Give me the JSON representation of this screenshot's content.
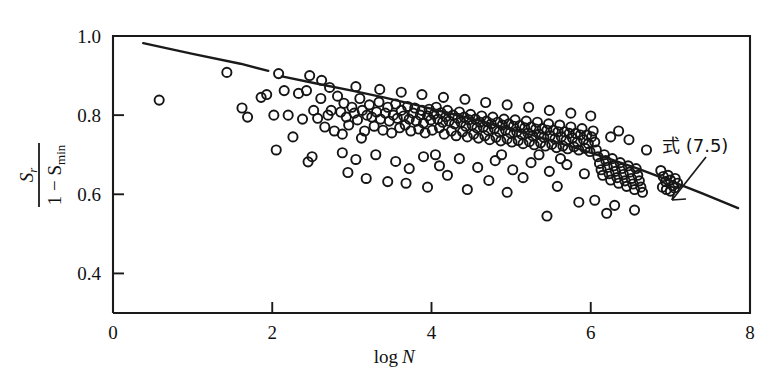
{
  "figure": {
    "background_color": "#ffffff",
    "ink_color": "#1a1a1a",
    "width": 778,
    "height": 385
  },
  "axes": {
    "x": {
      "label": "log N",
      "label_main": "log",
      "label_italic": "N",
      "ticks": [
        "0",
        "2",
        "4",
        "6",
        "8"
      ],
      "tick_values": [
        0,
        2,
        4,
        6,
        8
      ],
      "range": [
        0,
        8
      ]
    },
    "y": {
      "label_numerator": "S",
      "label_numerator_sub": "r",
      "label_denominator_lead": "1 − S",
      "label_denominator_sub": "min",
      "label_plain": "S_r / (1 - S_min)",
      "ticks": [
        "0.4",
        "0.6",
        "0.8",
        "1.0"
      ],
      "tick_values": [
        0.4,
        0.6,
        0.8,
        1.0
      ],
      "range": [
        0.3,
        1.0
      ]
    }
  },
  "annotations": [
    {
      "name": "equation-callout",
      "text": "式 (7.5)",
      "meaning": "Equation (7.5)",
      "x": 6.75,
      "y": 0.705,
      "leader_to_x": 6.55,
      "leader_to_y": 0.625
    }
  ],
  "chart_data": {
    "type": "scatter",
    "title": "",
    "xlabel": "log N",
    "ylabel": "S_r / (1 - S_min)",
    "xlim": [
      0,
      8
    ],
    "ylim": [
      0.3,
      1.0
    ],
    "grid": false,
    "legend": "none",
    "marker": "open-circle",
    "marker_size": 4.6,
    "series": [
      {
        "name": "measured data",
        "type": "scatter",
        "points": [
          [
            0.58,
            0.838
          ],
          [
            1.43,
            0.908
          ],
          [
            1.62,
            0.818
          ],
          [
            1.69,
            0.795
          ],
          [
            1.86,
            0.845
          ],
          [
            1.93,
            0.852
          ],
          [
            2.02,
            0.8
          ],
          [
            2.08,
            0.905
          ],
          [
            2.15,
            0.862
          ],
          [
            2.2,
            0.8
          ],
          [
            2.26,
            0.745
          ],
          [
            2.33,
            0.855
          ],
          [
            2.38,
            0.79
          ],
          [
            2.43,
            0.862
          ],
          [
            2.47,
            0.9
          ],
          [
            2.52,
            0.812
          ],
          [
            2.57,
            0.792
          ],
          [
            2.61,
            0.842
          ],
          [
            2.66,
            0.77
          ],
          [
            2.7,
            0.8
          ],
          [
            2.74,
            0.812
          ],
          [
            2.78,
            0.76
          ],
          [
            2.82,
            0.848
          ],
          [
            2.86,
            0.808
          ],
          [
            2.9,
            0.83
          ],
          [
            2.93,
            0.795
          ],
          [
            2.96,
            0.775
          ],
          [
            3.0,
            0.82
          ],
          [
            3.03,
            0.805
          ],
          [
            3.07,
            0.788
          ],
          [
            3.1,
            0.842
          ],
          [
            3.13,
            0.812
          ],
          [
            3.16,
            0.76
          ],
          [
            3.19,
            0.8
          ],
          [
            3.22,
            0.826
          ],
          [
            3.25,
            0.795
          ],
          [
            3.28,
            0.772
          ],
          [
            3.31,
            0.808
          ],
          [
            3.34,
            0.833
          ],
          [
            3.36,
            0.79
          ],
          [
            3.39,
            0.762
          ],
          [
            3.42,
            0.805
          ],
          [
            3.45,
            0.82
          ],
          [
            3.47,
            0.785
          ],
          [
            3.5,
            0.755
          ],
          [
            3.52,
            0.8
          ],
          [
            3.55,
            0.828
          ],
          [
            3.57,
            0.792
          ],
          [
            3.6,
            0.768
          ],
          [
            3.62,
            0.812
          ],
          [
            3.65,
            0.798
          ],
          [
            3.67,
            0.775
          ],
          [
            3.7,
            0.822
          ],
          [
            3.72,
            0.79
          ],
          [
            3.74,
            0.76
          ],
          [
            3.77,
            0.805
          ],
          [
            3.79,
            0.818
          ],
          [
            3.81,
            0.785
          ],
          [
            3.84,
            0.765
          ],
          [
            3.86,
            0.8
          ],
          [
            3.88,
            0.812
          ],
          [
            3.9,
            0.78
          ],
          [
            3.92,
            0.755
          ],
          [
            3.95,
            0.798
          ],
          [
            3.97,
            0.815
          ],
          [
            3.99,
            0.788
          ],
          [
            4.01,
            0.762
          ],
          [
            4.03,
            0.802
          ],
          [
            4.06,
            0.82
          ],
          [
            4.08,
            0.79
          ],
          [
            4.1,
            0.768
          ],
          [
            4.12,
            0.806
          ],
          [
            4.14,
            0.782
          ],
          [
            4.16,
            0.752
          ],
          [
            4.18,
            0.796
          ],
          [
            4.2,
            0.812
          ],
          [
            4.22,
            0.785
          ],
          [
            4.25,
            0.76
          ],
          [
            4.27,
            0.8
          ],
          [
            4.29,
            0.778
          ],
          [
            4.31,
            0.748
          ],
          [
            4.33,
            0.792
          ],
          [
            4.35,
            0.808
          ],
          [
            4.37,
            0.782
          ],
          [
            4.39,
            0.758
          ],
          [
            4.41,
            0.795
          ],
          [
            4.43,
            0.772
          ],
          [
            4.45,
            0.745
          ],
          [
            4.47,
            0.788
          ],
          [
            4.49,
            0.802
          ],
          [
            4.51,
            0.775
          ],
          [
            4.53,
            0.752
          ],
          [
            4.55,
            0.79
          ],
          [
            4.57,
            0.768
          ],
          [
            4.59,
            0.742
          ],
          [
            4.61,
            0.782
          ],
          [
            4.63,
            0.798
          ],
          [
            4.65,
            0.77
          ],
          [
            4.67,
            0.748
          ],
          [
            4.69,
            0.785
          ],
          [
            4.71,
            0.762
          ],
          [
            4.73,
            0.738
          ],
          [
            4.75,
            0.778
          ],
          [
            4.77,
            0.795
          ],
          [
            4.79,
            0.766
          ],
          [
            4.81,
            0.744
          ],
          [
            4.83,
            0.782
          ],
          [
            4.85,
            0.758
          ],
          [
            4.87,
            0.735
          ],
          [
            4.89,
            0.775
          ],
          [
            4.91,
            0.79
          ],
          [
            4.93,
            0.762
          ],
          [
            4.95,
            0.74
          ],
          [
            4.97,
            0.778
          ],
          [
            4.99,
            0.755
          ],
          [
            5.01,
            0.732
          ],
          [
            5.03,
            0.772
          ],
          [
            5.05,
            0.788
          ],
          [
            5.07,
            0.758
          ],
          [
            5.09,
            0.736
          ],
          [
            5.11,
            0.774
          ],
          [
            5.13,
            0.752
          ],
          [
            5.15,
            0.728
          ],
          [
            5.17,
            0.768
          ],
          [
            5.19,
            0.785
          ],
          [
            5.21,
            0.755
          ],
          [
            5.23,
            0.733
          ],
          [
            5.25,
            0.77
          ],
          [
            5.27,
            0.748
          ],
          [
            5.29,
            0.725
          ],
          [
            5.31,
            0.765
          ],
          [
            5.33,
            0.782
          ],
          [
            5.35,
            0.752
          ],
          [
            5.37,
            0.73
          ],
          [
            5.39,
            0.766
          ],
          [
            5.41,
            0.744
          ],
          [
            5.43,
            0.722
          ],
          [
            5.45,
            0.762
          ],
          [
            5.47,
            0.778
          ],
          [
            5.49,
            0.748
          ],
          [
            5.51,
            0.726
          ],
          [
            5.53,
            0.762
          ],
          [
            5.55,
            0.74
          ],
          [
            5.57,
            0.718
          ],
          [
            5.59,
            0.758
          ],
          [
            5.61,
            0.775
          ],
          [
            5.63,
            0.745
          ],
          [
            5.65,
            0.722
          ],
          [
            5.67,
            0.758
          ],
          [
            5.69,
            0.736
          ],
          [
            5.71,
            0.715
          ],
          [
            5.73,
            0.754
          ],
          [
            5.75,
            0.77
          ],
          [
            5.77,
            0.742
          ],
          [
            5.79,
            0.72
          ],
          [
            5.81,
            0.754
          ],
          [
            5.83,
            0.732
          ],
          [
            5.85,
            0.712
          ],
          [
            5.87,
            0.75
          ],
          [
            5.89,
            0.766
          ],
          [
            5.91,
            0.738
          ],
          [
            5.93,
            0.716
          ],
          [
            5.95,
            0.75
          ],
          [
            5.97,
            0.728
          ],
          [
            5.99,
            0.708
          ],
          [
            6.01,
            0.745
          ],
          [
            6.03,
            0.76
          ],
          [
            6.05,
            0.732
          ],
          [
            6.07,
            0.712
          ],
          [
            6.09,
            0.695
          ],
          [
            6.11,
            0.678
          ],
          [
            6.13,
            0.662
          ],
          [
            6.15,
            0.648
          ],
          [
            6.17,
            0.7
          ],
          [
            6.19,
            0.685
          ],
          [
            6.21,
            0.668
          ],
          [
            6.23,
            0.652
          ],
          [
            6.25,
            0.636
          ],
          [
            6.27,
            0.69
          ],
          [
            6.29,
            0.672
          ],
          [
            6.31,
            0.658
          ],
          [
            6.33,
            0.642
          ],
          [
            6.35,
            0.628
          ],
          [
            6.37,
            0.68
          ],
          [
            6.39,
            0.665
          ],
          [
            6.41,
            0.65
          ],
          [
            6.43,
            0.634
          ],
          [
            6.45,
            0.62
          ],
          [
            6.47,
            0.672
          ],
          [
            6.49,
            0.656
          ],
          [
            6.51,
            0.64
          ],
          [
            6.53,
            0.626
          ],
          [
            6.55,
            0.612
          ],
          [
            6.57,
            0.665
          ],
          [
            6.59,
            0.648
          ],
          [
            6.61,
            0.634
          ],
          [
            6.63,
            0.618
          ],
          [
            6.65,
            0.605
          ],
          [
            6.88,
            0.66
          ],
          [
            6.91,
            0.645
          ],
          [
            6.94,
            0.632
          ],
          [
            6.97,
            0.648
          ],
          [
            7.0,
            0.636
          ],
          [
            7.03,
            0.622
          ],
          [
            7.06,
            0.64
          ],
          [
            7.09,
            0.628
          ],
          [
            6.9,
            0.618
          ],
          [
            6.95,
            0.612
          ],
          [
            7.0,
            0.608
          ],
          [
            7.05,
            0.616
          ],
          [
            2.05,
            0.712
          ],
          [
            2.5,
            0.695
          ],
          [
            2.88,
            0.705
          ],
          [
            3.05,
            0.688
          ],
          [
            3.3,
            0.7
          ],
          [
            3.55,
            0.683
          ],
          [
            3.72,
            0.665
          ],
          [
            3.9,
            0.695
          ],
          [
            4.1,
            0.672
          ],
          [
            4.35,
            0.69
          ],
          [
            4.58,
            0.668
          ],
          [
            4.8,
            0.685
          ],
          [
            5.02,
            0.662
          ],
          [
            5.25,
            0.68
          ],
          [
            5.48,
            0.658
          ],
          [
            5.7,
            0.675
          ],
          [
            5.92,
            0.652
          ],
          [
            3.18,
            0.64
          ],
          [
            3.68,
            0.628
          ],
          [
            4.2,
            0.648
          ],
          [
            4.72,
            0.635
          ],
          [
            5.15,
            0.642
          ],
          [
            5.58,
            0.62
          ],
          [
            6.05,
            0.585
          ],
          [
            6.3,
            0.572
          ],
          [
            5.45,
            0.545
          ],
          [
            4.95,
            0.605
          ],
          [
            4.45,
            0.612
          ],
          [
            3.95,
            0.618
          ],
          [
            3.45,
            0.632
          ],
          [
            2.95,
            0.655
          ],
          [
            2.45,
            0.682
          ],
          [
            6.55,
            0.56
          ],
          [
            6.2,
            0.552
          ],
          [
            5.85,
            0.58
          ],
          [
            2.62,
            0.888
          ],
          [
            2.72,
            0.87
          ],
          [
            3.05,
            0.872
          ],
          [
            3.35,
            0.865
          ],
          [
            3.62,
            0.858
          ],
          [
            3.88,
            0.852
          ],
          [
            4.15,
            0.845
          ],
          [
            4.42,
            0.84
          ],
          [
            4.68,
            0.832
          ],
          [
            4.95,
            0.826
          ],
          [
            5.22,
            0.82
          ],
          [
            5.48,
            0.812
          ],
          [
            5.75,
            0.805
          ],
          [
            6.0,
            0.798
          ],
          [
            6.25,
            0.745
          ],
          [
            6.48,
            0.738
          ],
          [
            6.7,
            0.712
          ],
          [
            6.35,
            0.76
          ],
          [
            2.88,
            0.752
          ],
          [
            3.12,
            0.742
          ],
          [
            4.05,
            0.7
          ],
          [
            4.88,
            0.7
          ],
          [
            5.35,
            0.7
          ],
          [
            5.62,
            0.69
          ]
        ]
      }
    ],
    "fit_line": {
      "name": "式 (7.5)",
      "type": "line",
      "description": "Fitted trend curve for Equation (7.5), drawn as a broken (gapped) polyline",
      "segments": [
        [
          [
            0.38,
            0.982
          ],
          [
            1.0,
            0.955
          ],
          [
            1.6,
            0.93
          ],
          [
            1.95,
            0.912
          ]
        ],
        [
          [
            2.12,
            0.898
          ],
          [
            2.6,
            0.878
          ],
          [
            3.0,
            0.862
          ],
          [
            3.4,
            0.845
          ],
          [
            3.8,
            0.826
          ],
          [
            4.2,
            0.806
          ],
          [
            4.6,
            0.786
          ],
          [
            5.0,
            0.764
          ],
          [
            5.4,
            0.742
          ],
          [
            5.8,
            0.718
          ],
          [
            6.2,
            0.692
          ],
          [
            6.6,
            0.664
          ],
          [
            7.0,
            0.634
          ],
          [
            7.4,
            0.602
          ],
          [
            7.85,
            0.565
          ]
        ]
      ]
    }
  }
}
